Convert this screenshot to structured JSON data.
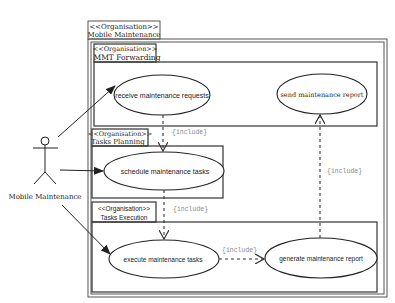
{
  "diagram": {
    "type": "uml-use-case",
    "actor": {
      "label": "Mobile Maintenance"
    },
    "packages": [
      {
        "id": "outer",
        "stereotype": "<<Organisation>>",
        "name": "Mobile Maintenance"
      },
      {
        "id": "mmt",
        "stereotype": "<<Organisation>>",
        "name": "MMT Forwarding"
      },
      {
        "id": "planning",
        "stereotype": "<<Organisation>>",
        "name": "Tasks Planning"
      },
      {
        "id": "execution",
        "stereotype": "<<Organisation>>",
        "name": "Tasks Execution"
      }
    ],
    "use_cases": [
      {
        "id": "uc1",
        "label": "receive maintenance requests",
        "package": "mmt"
      },
      {
        "id": "uc2",
        "label": "send maintenance report",
        "package": "mmt"
      },
      {
        "id": "uc3",
        "label": "schedule maintenance tasks",
        "package": "planning"
      },
      {
        "id": "uc4",
        "label": "execute maintenance tasks",
        "package": "execution"
      },
      {
        "id": "uc5",
        "label": "generate maintenance report",
        "package": "execution"
      }
    ],
    "relations": [
      {
        "from": "actor",
        "to": "uc1",
        "type": "association"
      },
      {
        "from": "actor",
        "to": "uc3",
        "type": "association"
      },
      {
        "from": "actor",
        "to": "uc4",
        "type": "association"
      },
      {
        "from": "uc1",
        "to": "uc3",
        "type": "include",
        "label": "{include}"
      },
      {
        "from": "uc3",
        "to": "uc4",
        "type": "include",
        "label": "{include}"
      },
      {
        "from": "uc4",
        "to": "uc5",
        "type": "include",
        "label": "{include}"
      },
      {
        "from": "uc5",
        "to": "uc2",
        "type": "include",
        "label": "{include}"
      }
    ]
  }
}
